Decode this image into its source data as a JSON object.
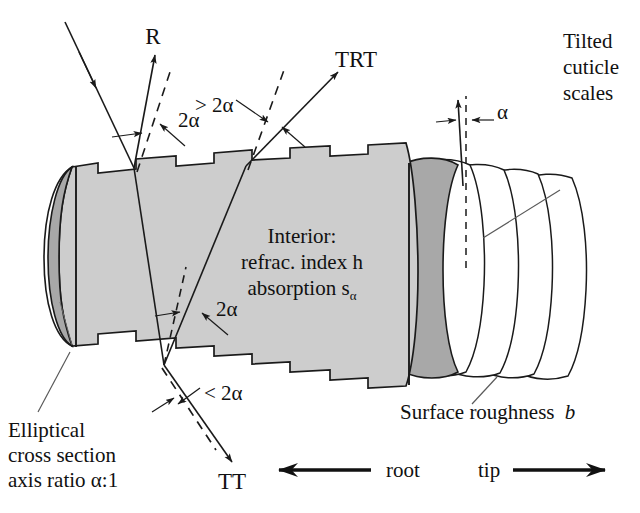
{
  "figure": {
    "colors": {
      "body_fill": "#cdcdcd",
      "end_cap_fill": "#a8a8a8",
      "scale_fill": "#ffffff",
      "stroke": "#1a1a1a",
      "leader": "#5a5a5a"
    }
  },
  "rays": {
    "reflection": {
      "label": "R"
    },
    "transmission_reflection_transmission": {
      "label": "TRT"
    },
    "transmission_transmission": {
      "label": "TT"
    }
  },
  "angles": {
    "reflection_angle": "2α",
    "trt_angle": "> 2α",
    "interior_angle": "2α",
    "tt_angle": "< 2α",
    "cuticle_tilt": "α"
  },
  "annotations": {
    "interior": {
      "line1": "Interior:",
      "line2": "refrac. index h",
      "line3_text": "absorption s",
      "line3_sub": "α"
    },
    "cuticle": {
      "line1": "Tilted",
      "line2": "cuticle",
      "line3": "scales"
    },
    "cross_section": {
      "line1": "Elliptical",
      "line2": "cross section",
      "line3": "axis ratio α:1"
    },
    "surface_roughness": {
      "text": "Surface roughness",
      "symbol": "b"
    }
  },
  "axis": {
    "root_label": "root",
    "tip_label": "tip"
  }
}
